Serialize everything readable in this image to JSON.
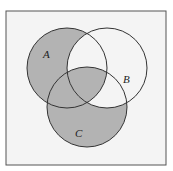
{
  "diagram": {
    "type": "venn",
    "sets": [
      {
        "id": "A",
        "label": "A",
        "cx": 67,
        "cy": 68,
        "r": 40
      },
      {
        "id": "B",
        "label": "B",
        "cx": 107,
        "cy": 68,
        "r": 40
      },
      {
        "id": "C",
        "label": "C",
        "cx": 87,
        "cy": 107,
        "r": 40
      }
    ],
    "shaded_regions": [
      "A only",
      "A∩C only",
      "C only",
      "A∩B∩C"
    ],
    "unshaded_regions": [
      "B only",
      "A∩B only",
      "B∩C only",
      "outside"
    ],
    "colors": {
      "background": "#f4f4f4",
      "shade": "#b3b3b3",
      "stroke": "#333333"
    }
  }
}
